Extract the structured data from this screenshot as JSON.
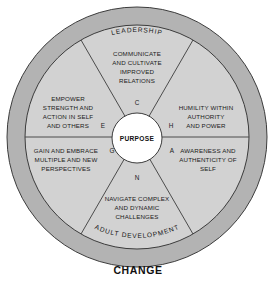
{
  "diagram": {
    "title": "CHANGE",
    "hub_label": "PURPOSE",
    "outer_ring": {
      "top_label": "LEADERSHIP",
      "bottom_label": "ADULT DEVELOPMENT"
    },
    "colors": {
      "outer_ring_fill": "#b3b3b3",
      "inner_disc_fill": "#d2d2d2",
      "hub_fill": "#ffffff",
      "stroke": "#3c3c3c",
      "text": "#161616",
      "background": "#ffffff"
    },
    "segments": [
      {
        "key": "C",
        "letter": "C",
        "position": "top",
        "lines": [
          "COMMUNICATE",
          "AND CULTIVATE",
          "IMPROVED",
          "RELATIONS"
        ]
      },
      {
        "key": "H",
        "letter": "H",
        "position": "upper-right",
        "lines": [
          "HUMILITY WITHIN",
          "AUTHORITY",
          "AND POWER"
        ]
      },
      {
        "key": "A",
        "letter": "A",
        "position": "lower-right",
        "lines": [
          "AWARENESS AND",
          "AUTHENTICITY OF",
          "SELF"
        ]
      },
      {
        "key": "N",
        "letter": "N",
        "position": "bottom",
        "lines": [
          "NAVIGATE COMPLEX",
          "AND DYNAMIC",
          "CHALLENGES"
        ]
      },
      {
        "key": "G",
        "letter": "G",
        "position": "lower-left",
        "lines": [
          "GAIN AND EMBRACE",
          "MULTIPLE AND NEW",
          "PERSPECTIVES"
        ]
      },
      {
        "key": "E",
        "letter": "E",
        "position": "upper-left",
        "lines": [
          "EMPOWER",
          "STRENGTH AND",
          "ACTION IN SELF",
          "AND OTHERS"
        ]
      }
    ]
  }
}
